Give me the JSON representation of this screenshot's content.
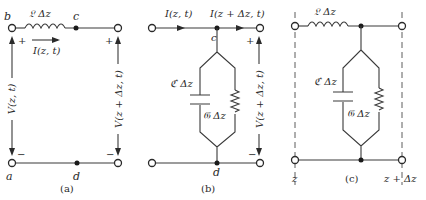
{
  "figure": {
    "panel_a": {
      "caption": "(a)",
      "inductor_label": "𝔏 Δz",
      "current_label": "I(z, t)",
      "left_voltage_label": "V(z, t)",
      "right_voltage_label": "V(z + Δz, t)",
      "node_b": "b",
      "node_c": "c",
      "node_a": "a",
      "node_d": "d",
      "plus": "+",
      "minus": "−"
    },
    "panel_b": {
      "caption": "(b)",
      "current_in_label": "I(z, t)",
      "current_out_label": "I(z + Δz, t)",
      "capacitor_label": "ℭ Δz",
      "conductance_label": "𝔊 Δz",
      "voltage_label": "V(z + Δz, t)",
      "node_c": "c",
      "node_d": "d",
      "plus": "+",
      "minus": "−"
    },
    "panel_c": {
      "caption": "(c)",
      "inductor_label": "𝔏 Δz",
      "capacitor_label": "ℭ Δz",
      "conductance_label": "𝔊 Δz",
      "left_position": "z",
      "right_position": "z + Δz"
    }
  }
}
